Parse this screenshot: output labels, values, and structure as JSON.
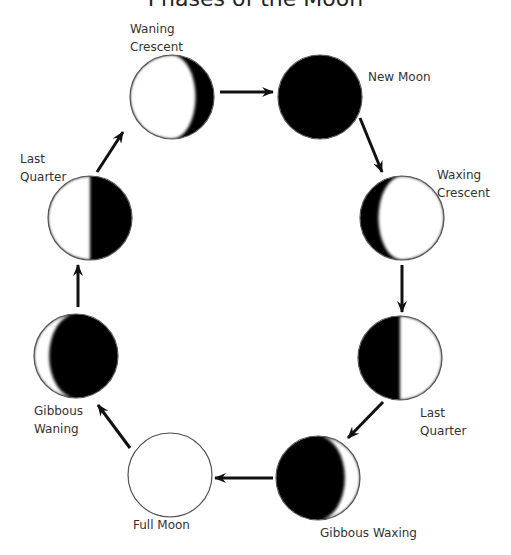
{
  "title": "Phases of the Moon",
  "colors": {
    "dark": "#000000",
    "light": "#ffffff",
    "outline": "#555555",
    "text": "#333333",
    "arrow": "#111111"
  },
  "phases": [
    {
      "key": "waning_crescent",
      "label_line1": "Waning",
      "label_line2": "Crescent",
      "cx": 172,
      "cy": 97,
      "r": 42,
      "lit": "left",
      "lit_fraction": 0.22
    },
    {
      "key": "new_moon",
      "label_line1": "New Moon",
      "label_line2": "",
      "cx": 320,
      "cy": 97,
      "r": 42,
      "lit": "none",
      "lit_fraction": 0
    },
    {
      "key": "waxing_crescent",
      "label_line1": "Waxing",
      "label_line2": "Crescent",
      "cx": 402,
      "cy": 218,
      "r": 42,
      "lit": "right",
      "lit_fraction": 0.22
    },
    {
      "key": "last_quarter_right",
      "label_line1": "Last",
      "label_line2": "Quarter",
      "cx": 400,
      "cy": 358,
      "r": 42,
      "lit": "right",
      "lit_fraction": 0.5
    },
    {
      "key": "gibbous_waxing",
      "label_line1": "Gibbous Waxing",
      "label_line2": "",
      "cx": 318,
      "cy": 478,
      "r": 42,
      "lit": "right",
      "lit_fraction": 0.82
    },
    {
      "key": "full_moon",
      "label_line1": "Full Moon",
      "label_line2": "",
      "cx": 170,
      "cy": 475,
      "r": 42,
      "lit": "full",
      "lit_fraction": 1
    },
    {
      "key": "gibbous_waning",
      "label_line1": "Gibbous",
      "label_line2": "Waning",
      "cx": 76,
      "cy": 356,
      "r": 42,
      "lit": "left",
      "lit_fraction": 0.82
    },
    {
      "key": "last_quarter_left",
      "label_line1": "Last",
      "label_line2": "Quarter",
      "cx": 90,
      "cy": 218,
      "r": 42,
      "lit": "left",
      "lit_fraction": 0.5
    }
  ],
  "arrows": [
    {
      "from": "waning_crescent",
      "to": "new_moon",
      "x1": 220,
      "y1": 92,
      "x2": 273,
      "y2": 92
    },
    {
      "from": "new_moon",
      "to": "waxing_crescent",
      "x1": 360,
      "y1": 118,
      "x2": 382,
      "y2": 172
    },
    {
      "from": "waxing_crescent",
      "to": "last_quarter_right",
      "x1": 402,
      "y1": 265,
      "x2": 402,
      "y2": 312
    },
    {
      "from": "last_quarter_right",
      "to": "gibbous_waxing",
      "x1": 383,
      "y1": 402,
      "x2": 348,
      "y2": 438
    },
    {
      "from": "gibbous_waxing",
      "to": "full_moon",
      "x1": 273,
      "y1": 478,
      "x2": 215,
      "y2": 478
    },
    {
      "from": "full_moon",
      "to": "gibbous_waning",
      "x1": 130,
      "y1": 448,
      "x2": 98,
      "y2": 405
    },
    {
      "from": "gibbous_waning",
      "to": "last_quarter_left",
      "x1": 78,
      "y1": 307,
      "x2": 78,
      "y2": 265
    },
    {
      "from": "last_quarter_left",
      "to": "waning_crescent",
      "x1": 97,
      "y1": 172,
      "x2": 123,
      "y2": 132
    }
  ],
  "labels": [
    {
      "phase": "waning_crescent",
      "x": 130,
      "y": 20
    },
    {
      "phase": "new_moon",
      "x": 368,
      "y": 68
    },
    {
      "phase": "waxing_crescent",
      "x": 437,
      "y": 166
    },
    {
      "phase": "last_quarter_right",
      "x": 420,
      "y": 404
    },
    {
      "phase": "gibbous_waxing",
      "x": 320,
      "y": 524
    },
    {
      "phase": "full_moon",
      "x": 133,
      "y": 516
    },
    {
      "phase": "gibbous_waning",
      "x": 34,
      "y": 402
    },
    {
      "phase": "last_quarter_left",
      "x": 20,
      "y": 150
    }
  ]
}
